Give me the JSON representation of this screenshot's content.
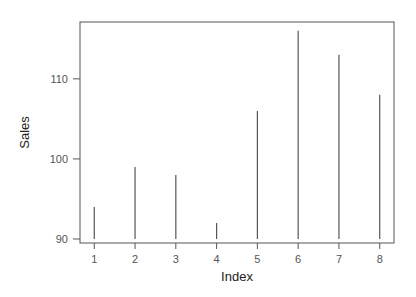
{
  "chart_data": {
    "type": "bar",
    "style": "histogram-lines",
    "title": "",
    "xlabel": "Index",
    "ylabel": "Sales",
    "categories": [
      "1",
      "2",
      "3",
      "4",
      "5",
      "6",
      "7",
      "8"
    ],
    "x": [
      1,
      2,
      3,
      4,
      5,
      6,
      7,
      8
    ],
    "values": [
      94,
      99,
      98,
      92,
      106,
      116,
      113,
      108
    ],
    "baseline": 90,
    "xlim": [
      0.65,
      8.35
    ],
    "ylim": [
      89.5,
      117.1
    ],
    "xticks": [
      1,
      2,
      3,
      4,
      5,
      6,
      7,
      8
    ],
    "yticks": [
      90,
      100,
      110
    ],
    "xtick_labels": [
      "1",
      "2",
      "3",
      "4",
      "5",
      "6",
      "7",
      "8"
    ],
    "ytick_labels": [
      "90",
      "100",
      "110"
    ],
    "grid": false,
    "legend": null,
    "colors": {
      "line": "#555555",
      "frame": "#555555",
      "text": "#555555"
    }
  }
}
